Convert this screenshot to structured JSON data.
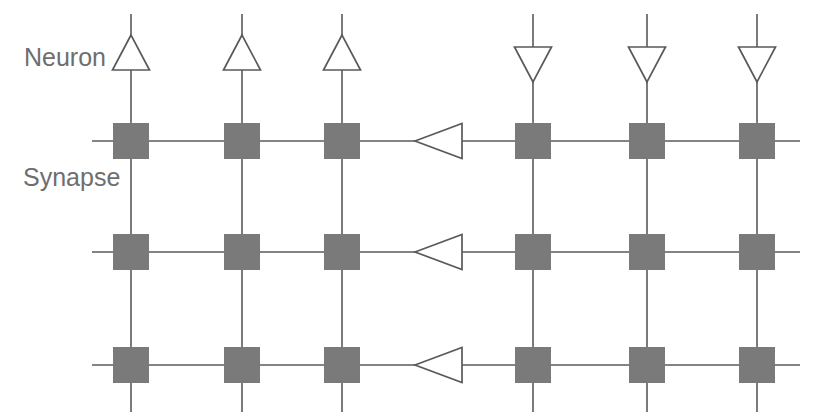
{
  "figure": {
    "background_color": "#ffffff"
  },
  "labels": {
    "neuron": "Neuron",
    "synapse": "Synapse",
    "text_color": "#6e6e6e",
    "neuron_label_pos": {
      "x": 24,
      "y": 66
    },
    "synapse_label_pos": {
      "x": 23,
      "y": 186
    }
  },
  "colors": {
    "synapse_fill": "#7a7a7a",
    "wire_stroke": "#5a5a5a",
    "neuron_fill": "#ffffff",
    "neuron_stroke": "#5a5a5a",
    "label": "#6e6e6e"
  },
  "geometry": {
    "width": 829,
    "height": 419,
    "column_x": [
      131,
      242,
      342,
      533,
      647,
      757
    ],
    "row_y": [
      141,
      252,
      365
    ],
    "synapse_size": 36,
    "column_line_top": 14,
    "column_line_bottom": 412,
    "row_line_left": 92,
    "row_line_right": 800,
    "triangle_width": 37,
    "triangle_height": 35,
    "row_triangle_x": 438
  },
  "neurons": {
    "count": 6,
    "label": "Neuron",
    "column_neurons": [
      {
        "id": "neuron-col-1",
        "x": 131,
        "direction": "up",
        "apex_y": 35,
        "base_y": 70
      },
      {
        "id": "neuron-col-2",
        "x": 242,
        "direction": "up",
        "apex_y": 35,
        "base_y": 70
      },
      {
        "id": "neuron-col-3",
        "x": 342,
        "direction": "up",
        "apex_y": 35,
        "base_y": 70
      },
      {
        "id": "neuron-col-4",
        "x": 533,
        "direction": "down",
        "apex_y": 82,
        "base_y": 47
      },
      {
        "id": "neuron-col-5",
        "x": 647,
        "direction": "down",
        "apex_y": 82,
        "base_y": 47
      },
      {
        "id": "neuron-col-6",
        "x": 757,
        "direction": "down",
        "apex_y": 82,
        "base_y": 47
      }
    ],
    "row_neurons": [
      {
        "id": "neuron-row-1",
        "y": 141,
        "direction": "left",
        "apex_x": 415,
        "base_x": 462
      },
      {
        "id": "neuron-row-2",
        "y": 252,
        "direction": "left",
        "apex_x": 415,
        "base_x": 462
      },
      {
        "id": "neuron-row-3",
        "y": 365,
        "direction": "left",
        "apex_x": 415,
        "base_x": 462
      }
    ]
  },
  "synapses": {
    "label": "Synapse",
    "count": 18,
    "rows": 3,
    "columns": 6,
    "fill": "#7a7a7a",
    "size": 36,
    "items": [
      {
        "id": "synapse-r1-c1",
        "row": 1,
        "col": 1,
        "cx": 131,
        "cy": 141
      },
      {
        "id": "synapse-r1-c2",
        "row": 1,
        "col": 2,
        "cx": 242,
        "cy": 141
      },
      {
        "id": "synapse-r1-c3",
        "row": 1,
        "col": 3,
        "cx": 342,
        "cy": 141
      },
      {
        "id": "synapse-r1-c4",
        "row": 1,
        "col": 4,
        "cx": 533,
        "cy": 141
      },
      {
        "id": "synapse-r1-c5",
        "row": 1,
        "col": 5,
        "cx": 647,
        "cy": 141
      },
      {
        "id": "synapse-r1-c6",
        "row": 1,
        "col": 6,
        "cx": 757,
        "cy": 141
      },
      {
        "id": "synapse-r2-c1",
        "row": 2,
        "col": 1,
        "cx": 131,
        "cy": 252
      },
      {
        "id": "synapse-r2-c2",
        "row": 2,
        "col": 2,
        "cx": 242,
        "cy": 252
      },
      {
        "id": "synapse-r2-c3",
        "row": 2,
        "col": 3,
        "cx": 342,
        "cy": 252
      },
      {
        "id": "synapse-r2-c4",
        "row": 2,
        "col": 4,
        "cx": 533,
        "cy": 252
      },
      {
        "id": "synapse-r2-c5",
        "row": 2,
        "col": 5,
        "cx": 647,
        "cy": 252
      },
      {
        "id": "synapse-r2-c6",
        "row": 2,
        "col": 6,
        "cx": 757,
        "cy": 252
      },
      {
        "id": "synapse-r3-c1",
        "row": 3,
        "col": 1,
        "cx": 131,
        "cy": 365
      },
      {
        "id": "synapse-r3-c2",
        "row": 3,
        "col": 2,
        "cx": 242,
        "cy": 365
      },
      {
        "id": "synapse-r3-c3",
        "row": 3,
        "col": 3,
        "cx": 342,
        "cy": 365
      },
      {
        "id": "synapse-r3-c4",
        "row": 3,
        "col": 4,
        "cx": 533,
        "cy": 365
      },
      {
        "id": "synapse-r3-c5",
        "row": 3,
        "col": 5,
        "cx": 647,
        "cy": 365
      },
      {
        "id": "synapse-r3-c6",
        "row": 3,
        "col": 6,
        "cx": 757,
        "cy": 365
      }
    ]
  }
}
